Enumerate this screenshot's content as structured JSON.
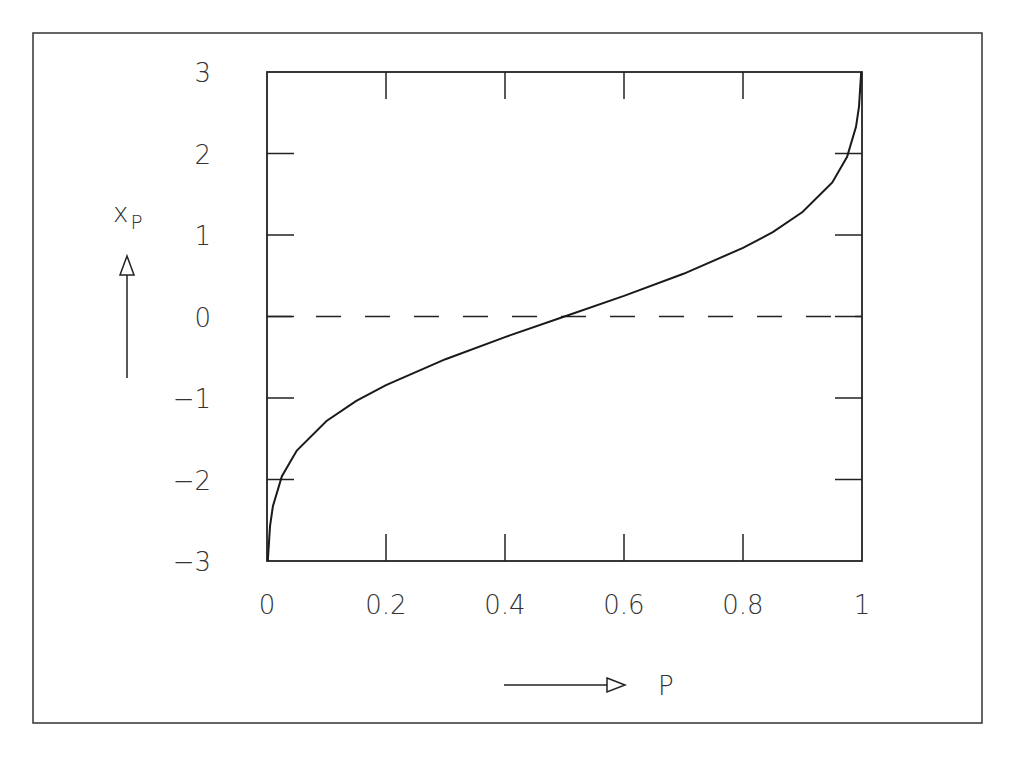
{
  "chart_data": {
    "type": "line",
    "title": "",
    "xlabel": "P",
    "ylabel": "x_P",
    "ylabel_main": "x",
    "ylabel_sub": "P",
    "xlim": [
      0,
      1
    ],
    "ylim": [
      -3,
      3
    ],
    "grid": false,
    "legend": null,
    "x_ticks": [
      0,
      0.2,
      0.4,
      0.6,
      0.8,
      1
    ],
    "x_tick_labels": [
      "0",
      "0.2",
      "0.4",
      "0.6",
      "0.8",
      "1"
    ],
    "y_ticks": [
      3,
      2,
      1,
      0,
      -1,
      -2,
      -3
    ],
    "y_tick_labels": [
      "3",
      "2",
      "1",
      "0",
      "−1",
      "−2",
      "−3"
    ],
    "series": [
      {
        "name": "quantile function (probit)",
        "style": "solid",
        "x": [
          0.00135,
          0.005,
          0.01,
          0.025,
          0.05,
          0.1,
          0.15,
          0.2,
          0.3,
          0.4,
          0.5,
          0.6,
          0.7,
          0.8,
          0.85,
          0.9,
          0.95,
          0.975,
          0.99,
          0.995,
          0.99865
        ],
        "y": [
          -3,
          -2.576,
          -2.326,
          -1.96,
          -1.645,
          -1.282,
          -1.036,
          -0.842,
          -0.524,
          -0.253,
          0,
          0.253,
          0.524,
          0.842,
          1.036,
          1.282,
          1.645,
          1.96,
          2.326,
          2.576,
          3
        ]
      },
      {
        "name": "zero reference",
        "style": "dashed",
        "x": [
          0,
          1
        ],
        "y": [
          0,
          0
        ]
      }
    ]
  },
  "colors": {
    "line": "#1a1a1a",
    "frame": "#333333",
    "text": "#333333"
  }
}
